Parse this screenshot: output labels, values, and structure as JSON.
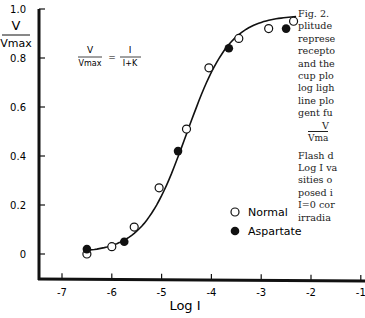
{
  "chart_data": {
    "type": "scatter",
    "title": "",
    "xlabel": "Log I",
    "ylabel": "V/Vmax",
    "xlim": [
      -7.5,
      -1
    ],
    "ylim": [
      -0.1,
      1.0
    ],
    "xticks": [
      "-7",
      "-6",
      "-5",
      "-4",
      "-3",
      "-2",
      "-1"
    ],
    "yticks": [
      "0",
      "0.2",
      "0.4",
      "0.6",
      "0.8",
      "1.0"
    ],
    "grid": false,
    "legend_position": "lower right",
    "annotation": {
      "lhs_num": "V",
      "lhs_den": "Vmax",
      "equals": "=",
      "rhs_num": "I",
      "rhs_den": "I+K"
    },
    "series": [
      {
        "name": "Normal",
        "marker": "open-circle",
        "x": [
          -6.5,
          -6.0,
          -5.55,
          -5.05,
          -4.5,
          -4.05,
          -3.45,
          -2.85,
          -2.35
        ],
        "y": [
          0.0,
          0.03,
          0.11,
          0.27,
          0.51,
          0.76,
          0.88,
          0.92,
          0.95
        ]
      },
      {
        "name": "Aspartate",
        "marker": "filled-circle",
        "x": [
          -6.5,
          -5.75,
          -4.67,
          -3.65,
          -2.5
        ],
        "y": [
          0.02,
          0.05,
          0.42,
          0.84,
          0.92
        ]
      },
      {
        "name": "fit",
        "type": "line",
        "formula": "V/Vmax = I/(I+K)",
        "logK": -4.5
      }
    ]
  },
  "caption": {
    "lines": [
      "Fig. 2.",
      "plitude",
      "represe",
      "recepto",
      "and the",
      "cup plo",
      "log ligh",
      "line plo",
      "gent fu"
    ],
    "formula_num": "V",
    "formula_den": "Vma",
    "lines2": [
      "Flash d",
      "Log I va",
      "sities o",
      "posed i",
      "I=0 cor",
      "irradia"
    ]
  }
}
